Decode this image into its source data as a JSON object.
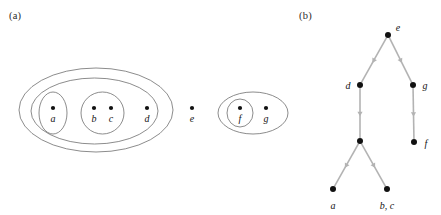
{
  "figure": {
    "type": "two-panel-figure",
    "background": "#ffffff",
    "stroke_color": "#6e6e6e",
    "edge_color": "#b3b3b3",
    "dot_color": "#111111",
    "text_color": "#141414"
  },
  "panel_a": {
    "label": "(a)",
    "description": "nested set diagram of elements a b c d e f g",
    "ellipses": [
      {
        "name": "outer-group",
        "cx": 96,
        "cy": 110,
        "rx": 77,
        "ry": 42
      },
      {
        "name": "second-group",
        "cx": 94.5,
        "cy": 111,
        "rx": 63.5,
        "ry": 33
      },
      {
        "name": "group-a",
        "cx": 53,
        "cy": 113,
        "rx": 14,
        "ry": 21
      },
      {
        "name": "group-bc",
        "cx": 102.5,
        "cy": 113,
        "rx": 21.5,
        "ry": 21
      },
      {
        "name": "group-fg",
        "cx": 253,
        "cy": 113,
        "rx": 35,
        "ry": 21
      },
      {
        "name": "group-f",
        "cx": 240,
        "cy": 113,
        "rx": 13,
        "ry": 14
      }
    ],
    "points": [
      {
        "name": "point-a",
        "label": "a",
        "x": 53,
        "y": 108
      },
      {
        "name": "point-b",
        "label": "b",
        "x": 94,
        "y": 108
      },
      {
        "name": "point-c",
        "label": "c",
        "x": 111,
        "y": 108
      },
      {
        "name": "point-d",
        "label": "d",
        "x": 147,
        "y": 108
      },
      {
        "name": "point-e",
        "label": "e",
        "x": 192,
        "y": 108
      },
      {
        "name": "point-f",
        "label": "f",
        "x": 240,
        "y": 108
      },
      {
        "name": "point-g",
        "label": "g",
        "x": 266,
        "y": 108
      }
    ]
  },
  "panel_b": {
    "label": "(b)",
    "description": "directed tree with vertices e d g f a and merged vertex b, c",
    "nodes": [
      {
        "name": "node-e",
        "label": "e",
        "x": 388,
        "y": 35,
        "label_dx": 10,
        "label_dy": -12
      },
      {
        "name": "node-d",
        "label": "d",
        "x": 360,
        "y": 85,
        "label_dx": -12,
        "label_dy": -4
      },
      {
        "name": "node-g",
        "label": "g",
        "x": 413,
        "y": 85,
        "label_dx": 12,
        "label_dy": -4
      },
      {
        "name": "node-mid",
        "label": "",
        "x": 360,
        "y": 141,
        "label_dx": 0,
        "label_dy": 0
      },
      {
        "name": "node-f",
        "label": "f",
        "x": 414,
        "y": 142,
        "label_dx": 12,
        "label_dy": -3
      },
      {
        "name": "node-a",
        "label": "a",
        "x": 333,
        "y": 189,
        "label_dx": 0,
        "label_dy": 12
      },
      {
        "name": "node-bc",
        "label": "b, c",
        "x": 387,
        "y": 189,
        "label_dx": 0,
        "label_dy": 12
      }
    ],
    "edges": [
      {
        "name": "edge-e-d",
        "from": "node-e",
        "to": "node-d"
      },
      {
        "name": "edge-e-g",
        "from": "node-e",
        "to": "node-g"
      },
      {
        "name": "edge-d-mid",
        "from": "node-d",
        "to": "node-mid"
      },
      {
        "name": "edge-g-f",
        "from": "node-g",
        "to": "node-f"
      },
      {
        "name": "edge-mid-a",
        "from": "node-mid",
        "to": "node-a"
      },
      {
        "name": "edge-mid-bc",
        "from": "node-mid",
        "to": "node-bc"
      }
    ]
  }
}
